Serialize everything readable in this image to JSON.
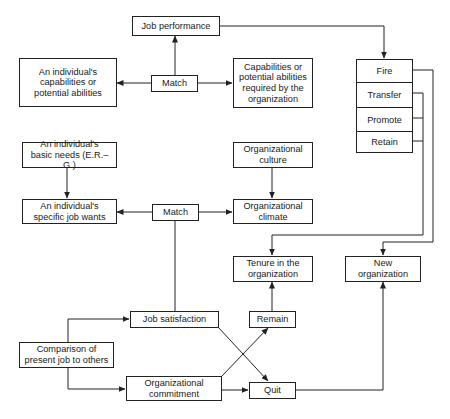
{
  "diagram": {
    "nodes": {
      "job_performance": "Job performance",
      "individual_capabilities": [
        "An individual's",
        "capabilities or",
        "potential abilities"
      ],
      "match_top": "Match",
      "org_capabilities": [
        "Capabilities or",
        "potential abilities",
        "required by the",
        "organization"
      ],
      "outcomes": [
        "Fire",
        "Transfer",
        "Promote",
        "Retain"
      ],
      "basic_needs": [
        "An individual's",
        "basic needs (E.R.–G.)"
      ],
      "org_culture": [
        "Organizational",
        "culture"
      ],
      "specific_wants": [
        "An individual's",
        "specific job wants"
      ],
      "match_bottom": "Match",
      "org_climate": [
        "Organizational",
        "climate"
      ],
      "tenure": [
        "Tenure in the",
        "organization"
      ],
      "new_org": [
        "New",
        "organization"
      ],
      "job_satisfaction": "Job satisfaction",
      "remain": "Remain",
      "comparison": [
        "Comparison of",
        "present job to others"
      ],
      "org_commitment": [
        "Organizational",
        "commitment"
      ],
      "quit": "Quit"
    },
    "edges": [
      [
        "match_top",
        "job_performance"
      ],
      [
        "match_top",
        "individual_capabilities"
      ],
      [
        "match_top",
        "org_capabilities"
      ],
      [
        "job_performance",
        "outcomes"
      ],
      [
        "outcomes.Fire",
        "new_org"
      ],
      [
        "outcomes.Transfer/Promote/Retain",
        "tenure"
      ],
      [
        "basic_needs",
        "specific_wants"
      ],
      [
        "org_culture",
        "org_climate"
      ],
      [
        "match_bottom",
        "specific_wants"
      ],
      [
        "match_bottom",
        "org_climate"
      ],
      [
        "match_bottom",
        "job_satisfaction"
      ],
      [
        "comparison",
        "job_satisfaction"
      ],
      [
        "comparison",
        "org_commitment"
      ],
      [
        "job_satisfaction",
        "quit"
      ],
      [
        "org_commitment",
        "remain"
      ],
      [
        "org_commitment",
        "quit"
      ],
      [
        "remain",
        "tenure"
      ],
      [
        "quit",
        "new_org"
      ]
    ],
    "line_color": "#222222"
  }
}
